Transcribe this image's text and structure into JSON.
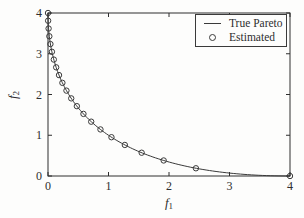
{
  "figure": {
    "background": "#fdfdfc",
    "ink_color": "#2e2e2e",
    "line_color": "#3a3a3a"
  },
  "chart_data": {
    "type": "line",
    "title": "",
    "xlabel": {
      "base": "f",
      "sub": "1"
    },
    "ylabel": {
      "base": "f",
      "sub": "2"
    },
    "xlim": [
      0,
      4
    ],
    "ylim": [
      0,
      4
    ],
    "xticks": [
      0,
      1,
      2,
      3,
      4
    ],
    "yticks": [
      0,
      1,
      2,
      3,
      4
    ],
    "grid": "off",
    "frame": "box",
    "legend": {
      "position": "top-right",
      "entries": [
        {
          "label": "True Pareto",
          "swatch": "line"
        },
        {
          "label": "Estimated",
          "swatch": "circle"
        }
      ]
    },
    "series": [
      {
        "name": "True Pareto",
        "style": "solid-line",
        "color": "#3a3a3a",
        "curve": {
          "formula": "f2 = (2 - sqrt(f1))^2",
          "a": 2,
          "t_range": [
            0,
            2
          ],
          "samples": 120
        }
      },
      {
        "name": "Estimated",
        "style": "open-circle-markers",
        "color": "#3a3a3a",
        "marker_radius": 2.7,
        "points": [
          [
            0.0,
            4.0
          ],
          [
            0.002,
            3.81
          ],
          [
            0.01,
            3.619
          ],
          [
            0.022,
            3.429
          ],
          [
            0.04,
            3.238
          ],
          [
            0.065,
            3.048
          ],
          [
            0.096,
            2.857
          ],
          [
            0.135,
            2.667
          ],
          [
            0.182,
            2.476
          ],
          [
            0.238,
            2.286
          ],
          [
            0.305,
            2.095
          ],
          [
            0.384,
            1.905
          ],
          [
            0.477,
            1.714
          ],
          [
            0.586,
            1.524
          ],
          [
            0.714,
            1.333
          ],
          [
            0.867,
            1.143
          ],
          [
            1.049,
            0.952
          ],
          [
            1.27,
            0.762
          ],
          [
            1.548,
            0.571
          ],
          [
            1.912,
            0.381
          ],
          [
            2.445,
            0.19
          ],
          [
            4.0,
            0.0
          ]
        ]
      }
    ]
  }
}
